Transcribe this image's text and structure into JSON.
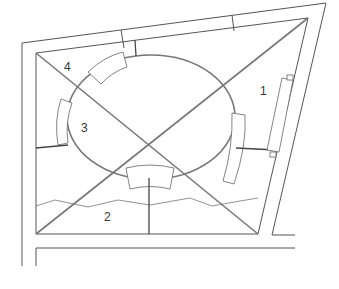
{
  "diagram": {
    "type": "architectural floor plan",
    "labels": [
      {
        "id": "1",
        "text": "1"
      },
      {
        "id": "2",
        "text": "2"
      },
      {
        "id": "3",
        "text": "3"
      },
      {
        "id": "4",
        "text": "4"
      }
    ],
    "colors": {
      "line": "#555555",
      "background": "#ffffff"
    }
  }
}
